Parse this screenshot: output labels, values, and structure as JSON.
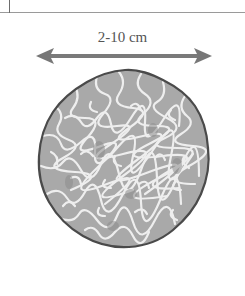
{
  "figure": {
    "size_label": "2-10 cm",
    "colors": {
      "arrow": "#7a7a7a",
      "outline": "#4a4a4a",
      "flesh": "#a9a9a9",
      "veins": "#eeeeee",
      "text": "#555555"
    }
  }
}
